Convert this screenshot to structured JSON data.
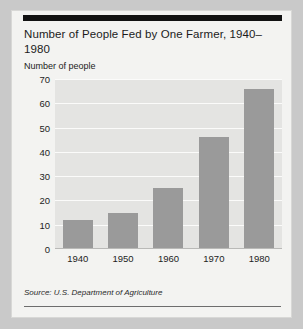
{
  "card": {
    "title": "Number of People Fed by One Farmer, 1940–1980",
    "source": "Source: U.S. Department of Agriculture"
  },
  "colors": {
    "bar": "#9a9a9a",
    "plot_background": "#e4e4e2",
    "card_background": "#f3f3f1",
    "gridline": "#fbfbfa",
    "rule": "#121212"
  },
  "chart_data": {
    "type": "bar",
    "title": "Number of People Fed by One Farmer, 1940–1980",
    "subtitle": "",
    "xlabel": "",
    "ylabel": "Number of people",
    "categories": [
      "1940",
      "1950",
      "1960",
      "1970",
      "1980"
    ],
    "values": [
      12,
      15,
      25,
      46,
      66
    ],
    "ylim": [
      0,
      70
    ],
    "ytick_labels": [
      "70",
      "60",
      "50",
      "40",
      "30",
      "20",
      "10",
      "0"
    ],
    "ytick_values": [
      70,
      60,
      50,
      40,
      30,
      20,
      10,
      0
    ],
    "grid": true,
    "legend": "none",
    "annotations": [
      "Source: U.S. Department of Agriculture"
    ]
  }
}
